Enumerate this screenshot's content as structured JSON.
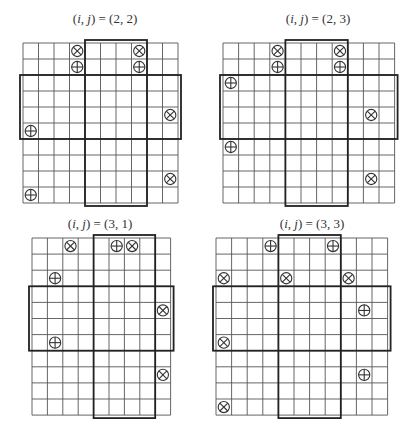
{
  "figure": {
    "panels": [
      {
        "title_prefix": "(i, j) = ",
        "title_value": "(2, 2)",
        "i": 2,
        "j": 2,
        "cols": 10,
        "rows": 10,
        "origin": [
          23,
          43
        ],
        "cell_w": 15.5,
        "cell_h": 16,
        "title_pos": [
          105,
          20
        ],
        "vertical_block": {
          "col_start": 5,
          "col_end": 8
        },
        "horizontal_block": {
          "row_start": 3,
          "row_end": 6
        },
        "markers": [
          {
            "row": 1,
            "col": 4,
            "type": "otimes"
          },
          {
            "row": 1,
            "col": 8,
            "type": "otimes"
          },
          {
            "row": 2,
            "col": 4,
            "type": "oplus"
          },
          {
            "row": 2,
            "col": 8,
            "type": "oplus"
          },
          {
            "row": 5,
            "col": 10,
            "type": "otimes"
          },
          {
            "row": 6,
            "col": 1,
            "type": "oplus"
          },
          {
            "row": 9,
            "col": 10,
            "type": "otimes"
          },
          {
            "row": 10,
            "col": 1,
            "type": "oplus"
          }
        ]
      },
      {
        "title_prefix": "(i, j) = ",
        "title_value": "(2, 3)",
        "i": 2,
        "j": 3,
        "cols": 11,
        "rows": 10,
        "origin": [
          223,
          43
        ],
        "cell_w": 15.6,
        "cell_h": 16,
        "title_pos": [
          318,
          20
        ],
        "vertical_block": {
          "col_start": 5,
          "col_end": 8
        },
        "horizontal_block": {
          "row_start": 3,
          "row_end": 6
        },
        "markers": [
          {
            "row": 1,
            "col": 4,
            "type": "otimes"
          },
          {
            "row": 1,
            "col": 8,
            "type": "otimes"
          },
          {
            "row": 2,
            "col": 4,
            "type": "oplus"
          },
          {
            "row": 2,
            "col": 8,
            "type": "oplus"
          },
          {
            "row": 3,
            "col": 1,
            "type": "oplus"
          },
          {
            "row": 5,
            "col": 10,
            "type": "otimes"
          },
          {
            "row": 7,
            "col": 1,
            "type": "oplus"
          },
          {
            "row": 9,
            "col": 10,
            "type": "otimes"
          }
        ]
      },
      {
        "title_prefix": "(i, j) = ",
        "title_value": "(3, 1)",
        "i": 3,
        "j": 1,
        "cols": 9,
        "rows": 11,
        "origin": [
          32,
          238
        ],
        "cell_w": 15.4,
        "cell_h": 16.1,
        "title_pos": [
          100,
          225
        ],
        "vertical_block": {
          "col_start": 5,
          "col_end": 8
        },
        "horizontal_block": {
          "row_start": 4,
          "row_end": 7
        },
        "markers": [
          {
            "row": 1,
            "col": 3,
            "type": "otimes"
          },
          {
            "row": 1,
            "col": 6,
            "type": "oplus"
          },
          {
            "row": 1,
            "col": 7,
            "type": "otimes"
          },
          {
            "row": 3,
            "col": 2,
            "type": "oplus"
          },
          {
            "row": 5,
            "col": 9,
            "type": "otimes"
          },
          {
            "row": 7,
            "col": 2,
            "type": "oplus"
          },
          {
            "row": 9,
            "col": 9,
            "type": "otimes"
          }
        ]
      },
      {
        "title_prefix": "(i, j) = ",
        "title_value": "(3, 3)",
        "i": 3,
        "j": 3,
        "cols": 11,
        "rows": 11,
        "origin": [
          216,
          238
        ],
        "cell_w": 15.6,
        "cell_h": 16.1,
        "title_pos": [
          312,
          225
        ],
        "vertical_block": {
          "col_start": 5,
          "col_end": 8
        },
        "horizontal_block": {
          "row_start": 4,
          "row_end": 7
        },
        "markers": [
          {
            "row": 1,
            "col": 4,
            "type": "oplus"
          },
          {
            "row": 1,
            "col": 8,
            "type": "oplus"
          },
          {
            "row": 3,
            "col": 1,
            "type": "otimes"
          },
          {
            "row": 3,
            "col": 5,
            "type": "otimes"
          },
          {
            "row": 3,
            "col": 9,
            "type": "otimes"
          },
          {
            "row": 5,
            "col": 10,
            "type": "oplus"
          },
          {
            "row": 7,
            "col": 1,
            "type": "otimes"
          },
          {
            "row": 9,
            "col": 10,
            "type": "oplus"
          },
          {
            "row": 11,
            "col": 1,
            "type": "otimes"
          }
        ]
      }
    ],
    "colors": {
      "grid_line": "#555555",
      "block_line": "#222222",
      "marker": "#333333"
    }
  }
}
